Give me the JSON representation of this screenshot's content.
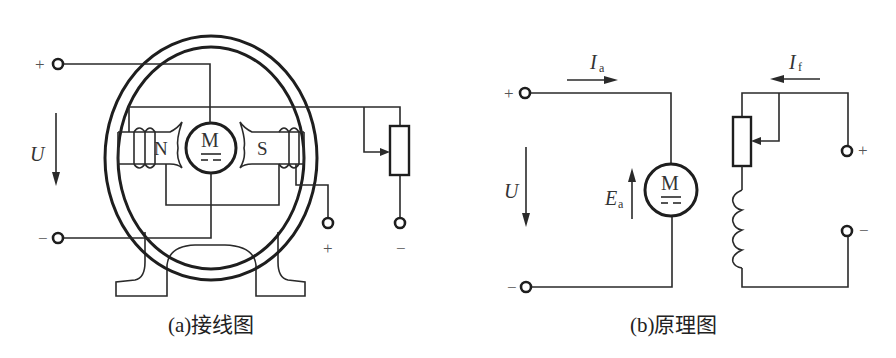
{
  "figure": {
    "panel_a": {
      "caption": "(a)接线图",
      "labels": {
        "voltage": "U",
        "plus": "+",
        "minus": "−",
        "motor": "M",
        "north_pole": "N",
        "south_pole": "S",
        "field_plus": "+",
        "field_minus": "−"
      }
    },
    "panel_b": {
      "caption": "(b)原理图",
      "labels": {
        "voltage": "U",
        "plus": "+",
        "minus": "−",
        "motor": "M",
        "armature_current": "I",
        "armature_current_sub": "a",
        "field_current": "I",
        "field_current_sub": "f",
        "emf": "E",
        "emf_sub": "a",
        "field_plus": "+",
        "field_minus": "−"
      }
    },
    "colors": {
      "line": "#2a2a2a",
      "background": "#ffffff"
    }
  }
}
